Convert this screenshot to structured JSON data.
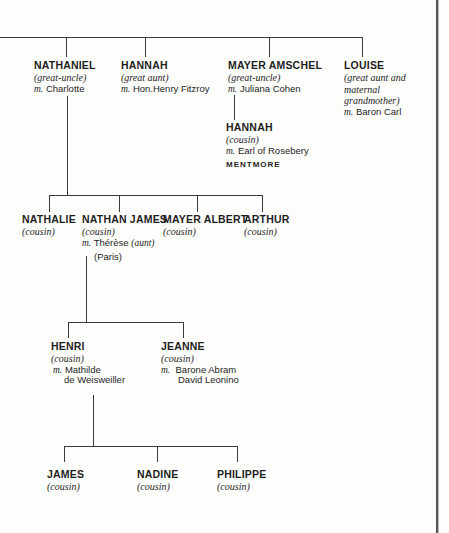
{
  "generation1": [
    {
      "name": "NATHANIEL",
      "relation": "(great-uncle)",
      "spouse_prefix": "m.",
      "spouse": "Charlotte"
    },
    {
      "name": "HANNAH",
      "relation": "(great aunt)",
      "spouse_prefix": "m.",
      "spouse": "Hon.Henry Fitzroy"
    },
    {
      "name": "MAYER AMSCHEL",
      "relation": "(great-uncle)",
      "spouse_prefix": "m.",
      "spouse": "Juliana Cohen"
    },
    {
      "name": "LOUISE",
      "relation_lines": [
        "(great aunt and",
        "maternal",
        "grandmother)"
      ],
      "spouse_prefix": "m.",
      "spouse": "Baron Carl"
    }
  ],
  "mayer_amschel_child": {
    "name": "HANNAH",
    "relation": "(cousin)",
    "spouse_prefix": "m.",
    "spouse": "Earl of Rosebery",
    "estate": "MENTMORE"
  },
  "generation2": [
    {
      "name": "NATHALIE",
      "relation": "(cousin)"
    },
    {
      "name": "NATHAN JAMES",
      "relation": "(cousin)",
      "spouse_prefix": "m.",
      "spouse": "Thérèse",
      "spouse_note": "(aunt)",
      "place": "(Paris)"
    },
    {
      "name": "MAYER ALBERT",
      "relation": "(cousin)"
    },
    {
      "name": "ARTHUR",
      "relation": "(cousin)"
    }
  ],
  "generation3": [
    {
      "name": "HENRI",
      "relation": "(cousin)",
      "spouse_prefix": "m.",
      "spouse_lines": [
        "Mathilde",
        "de Weisweiller"
      ]
    },
    {
      "name": "JEANNE",
      "relation": "(cousin)",
      "spouse_prefix": "m.",
      "spouse_lines": [
        "Barone Abram",
        "David Leonino"
      ]
    }
  ],
  "generation4": [
    {
      "name": "JAMES",
      "relation": "(cousin)"
    },
    {
      "name": "NADINE",
      "relation": "(cousin)"
    },
    {
      "name": "PHILIPPE",
      "relation": "(cousin)"
    }
  ]
}
